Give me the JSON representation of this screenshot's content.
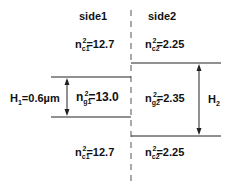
{
  "headers": {
    "side1": "side1",
    "side2": "side2"
  },
  "cladding_top": {
    "left": {
      "base": "n",
      "sub": "c1",
      "sup": "2",
      "value": "=12.7"
    },
    "right": {
      "base": "n",
      "sub": "c2",
      "sup": "2",
      "value": "=2.25"
    }
  },
  "core": {
    "left": {
      "base": "n",
      "sub": "g1",
      "sup": "2",
      "value": "=13.0"
    },
    "right": {
      "base": "n",
      "sub": "g2",
      "sup": "2",
      "value": "=2.35"
    }
  },
  "cladding_bottom": {
    "left": {
      "base": "n",
      "sub": "c1",
      "sup": "2",
      "value": "=12.7"
    },
    "right": {
      "base": "n",
      "sub": "c2",
      "sup": "2",
      "value": "=2.25"
    }
  },
  "dimensions": {
    "h1": {
      "base": "H",
      "sub": "1",
      "value": "=0.6µm"
    },
    "h2": {
      "base": "H",
      "sub": "2"
    }
  },
  "colors": {
    "line": "#222222",
    "text": "#111111",
    "background": "#ffffff"
  }
}
